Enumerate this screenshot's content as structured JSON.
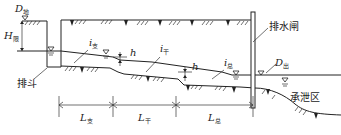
{
  "diagram": {
    "labels": {
      "d_field": {
        "main": "D",
        "sub": "地"
      },
      "h_field": {
        "main": "H",
        "sub": "限"
      },
      "pai_dou": "排斗",
      "i_zhi": {
        "main": "i",
        "sub": "支"
      },
      "i_gan": {
        "main": "i",
        "sub": "干"
      },
      "i_zong": {
        "main": "i",
        "sub": "总"
      },
      "h_drop_1": "h",
      "h_drop_2": "h",
      "pai_shui_zha": "排水闸",
      "d_out": {
        "main": "D",
        "sub": "出"
      },
      "cheng_xie_qu": "承泄区",
      "l_zhi": {
        "main": "L",
        "sub": "支"
      },
      "l_gan": {
        "main": "L",
        "sub": "干"
      },
      "l_zong": {
        "main": "L",
        "sub": "总"
      }
    },
    "segments": [
      {
        "name": "支沟",
        "length_label": "L支",
        "slope_label": "i支"
      },
      {
        "name": "干沟",
        "length_label": "L干",
        "slope_label": "i干"
      },
      {
        "name": "总沟",
        "length_label": "L总",
        "slope_label": "i总"
      }
    ],
    "colors": {
      "line": "#222222",
      "background": "#ffffff"
    }
  }
}
